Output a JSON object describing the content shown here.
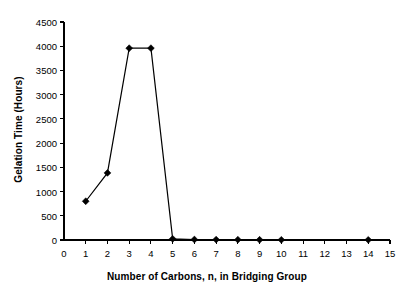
{
  "chart_data": {
    "type": "line",
    "title": "",
    "xlabel": "Number of Carbons, n, in Bridging Group",
    "ylabel": "Gelation Time (Hours)",
    "xlim": [
      0,
      15
    ],
    "ylim": [
      0,
      4500
    ],
    "xticks": [
      0,
      1,
      2,
      3,
      4,
      5,
      6,
      7,
      8,
      9,
      10,
      11,
      12,
      13,
      14,
      15
    ],
    "yticks": [
      0,
      500,
      1000,
      1500,
      2000,
      2500,
      3000,
      3500,
      4000,
      4500
    ],
    "grid": false,
    "legend": false,
    "marker": "filled-diamond",
    "series_color": "#000000",
    "x": [
      1,
      2,
      3,
      4,
      5,
      6,
      7,
      8,
      9,
      10,
      14
    ],
    "values": [
      800,
      1385,
      3960,
      3960,
      24,
      10,
      8,
      6,
      5,
      4,
      3
    ],
    "series": [
      {
        "name": "Gelation Time",
        "points": [
          {
            "x": 1,
            "y": 800
          },
          {
            "x": 2,
            "y": 1385
          },
          {
            "x": 3,
            "y": 3960
          },
          {
            "x": 4,
            "y": 3960
          },
          {
            "x": 5,
            "y": 24
          },
          {
            "x": 6,
            "y": 10
          },
          {
            "x": 7,
            "y": 8
          },
          {
            "x": 8,
            "y": 6
          },
          {
            "x": 9,
            "y": 5
          },
          {
            "x": 10,
            "y": 4
          },
          {
            "x": 14,
            "y": 3
          }
        ]
      }
    ]
  }
}
